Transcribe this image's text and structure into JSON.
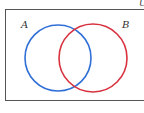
{
  "diagram": {
    "type": "venn",
    "universe_label": "U",
    "sets": [
      {
        "label": "A",
        "color": "#2f6fd6"
      },
      {
        "label": "B",
        "color": "#d8323f"
      }
    ],
    "frame_color": "#555555"
  }
}
